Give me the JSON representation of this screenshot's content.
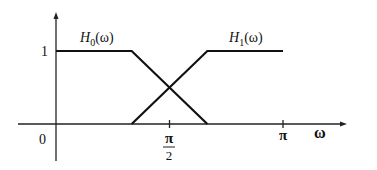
{
  "diagram": {
    "x_axis": {
      "label": "ω",
      "origin_label": "0",
      "range": [
        0,
        3.6
      ]
    },
    "y_axis": {
      "label": "",
      "tick_labels": [
        "1"
      ],
      "range": [
        0,
        1.3
      ]
    },
    "x_ticks": [
      {
        "value": 1.5708,
        "label_num": "π",
        "label_den": "2",
        "fraction": true
      },
      {
        "value": 3.1416,
        "label": "π",
        "fraction": false
      }
    ],
    "y_ticks": [
      {
        "value": 1,
        "label": "1"
      }
    ],
    "curves": [
      {
        "name": "H0",
        "label_main": "H",
        "label_sub": "0",
        "label_arg": "(ω)",
        "points": [
          [
            0,
            1
          ],
          [
            1.0472,
            1
          ],
          [
            2.0944,
            0
          ]
        ]
      },
      {
        "name": "H1",
        "label_main": "H",
        "label_sub": "1",
        "label_arg": "(ω)",
        "points": [
          [
            1.0472,
            0
          ],
          [
            2.0944,
            1
          ],
          [
            3.1416,
            1
          ]
        ]
      }
    ]
  }
}
